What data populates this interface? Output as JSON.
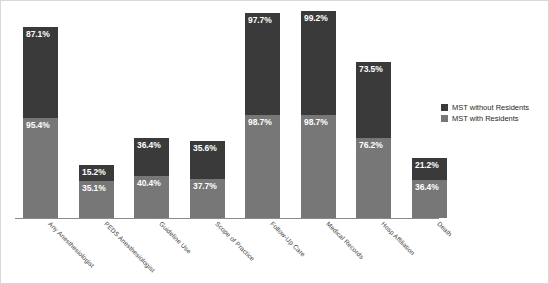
{
  "chart_data": {
    "type": "bar",
    "subtype": "stacked-column",
    "title": "",
    "xlabel": "",
    "ylabel": "",
    "ylim": [
      0,
      200
    ],
    "grid": false,
    "legend_position": "right",
    "categories": [
      "Any Anesthesiologist",
      "PEDS Anesthesiologist",
      "Guideline Use",
      "Scope of Practice",
      "Follow-Up Care",
      "Medical Records",
      "Hosp Affiliation",
      "Death"
    ],
    "series": [
      {
        "name": "MST without Residents",
        "color": "#3a3a3a",
        "values": [
          87.1,
          15.2,
          36.4,
          35.6,
          97.7,
          99.2,
          73.5,
          21.2
        ],
        "labels": [
          "87.1%",
          "15.2%",
          "36.4%",
          "35.6%",
          "97.7%",
          "99.2%",
          "73.5%",
          "21.2%"
        ]
      },
      {
        "name": "MST with Residents",
        "color": "#777777",
        "values": [
          95.4,
          35.1,
          40.4,
          37.7,
          98.7,
          98.7,
          76.2,
          36.4
        ],
        "labels": [
          "95.4%",
          "35.1%",
          "40.4%",
          "37.7%",
          "98.7%",
          "98.7%",
          "76.2%",
          "36.4%"
        ]
      }
    ]
  },
  "legend": {
    "items": [
      {
        "label": "MST without Residents",
        "color": "#3a3a3a"
      },
      {
        "label": "MST with Residents",
        "color": "#777777"
      }
    ]
  },
  "axis": {
    "baseline_color": "#8a8a8a"
  }
}
